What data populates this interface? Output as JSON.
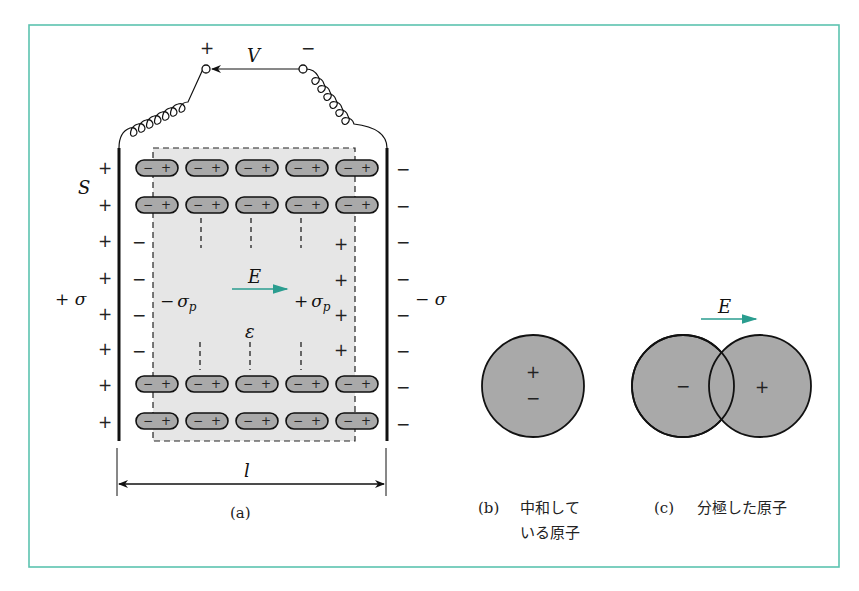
{
  "colors": {
    "frame": "#5cc3b0",
    "field_arrow": "#2a9d8f",
    "dielectric_fill": "#e6e6e6",
    "atom_fill": "#a9a9a9"
  },
  "panel_a": {
    "voltage_label": "V",
    "terminal_plus": "+",
    "terminal_minus": "−",
    "plate_label": "S",
    "left_plate_charge_label": "+ σ",
    "right_plate_charge_label": "− σ",
    "field_label": "E",
    "permittivity_label": "ε",
    "polarization_left_label": "− σp",
    "polarization_right_label": "+ σp",
    "polarization_left_sign": "−",
    "polarization_left_sub": "σ",
    "polarization_left_subscript": "p",
    "polarization_right_sign": "+",
    "polarization_right_sub": "σ",
    "polarization_right_subscript": "p",
    "length_label": "l",
    "caption": "(a)",
    "dipole_neg": "−",
    "dipole_pos": "+",
    "left_plate_signs": [
      "+",
      "+",
      "+",
      "+",
      "+",
      "+",
      "+",
      "+"
    ],
    "right_plate_signs": [
      "−",
      "−",
      "−",
      "−",
      "−",
      "−",
      "−",
      "−"
    ],
    "inner_left_signs": [
      "−",
      "−",
      "−",
      "−"
    ],
    "inner_right_signs": [
      "+",
      "+",
      "+",
      "+"
    ],
    "dipole_rows": 4,
    "dipoles_per_row": 5
  },
  "panel_b": {
    "atom_plus": "+",
    "atom_minus": "−",
    "caption_label": "(b)",
    "caption_line1": "中和して",
    "caption_line2": "いる原子"
  },
  "panel_c": {
    "field_label": "E",
    "atom_minus": "−",
    "atom_plus": "+",
    "caption_label": "(c)",
    "caption_text": "分極した原子"
  }
}
